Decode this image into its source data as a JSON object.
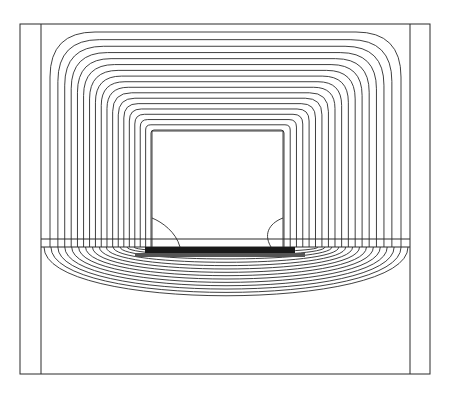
{
  "figure": {
    "stroke_color": "#2a2a2a",
    "background": "#ffffff"
  },
  "geometry": {
    "outer_frame": {
      "x1": 20,
      "y1": 24,
      "x2": 430,
      "y2": 374
    },
    "inner_left_x": 41,
    "inner_right_x": 410,
    "band_top_y": 239,
    "band_bottom_y": 247,
    "window": {
      "x1": 152,
      "y1": 131,
      "x2": 283,
      "y2": 247
    },
    "upper_contour_count": 18,
    "lower_arc_count": 14
  }
}
